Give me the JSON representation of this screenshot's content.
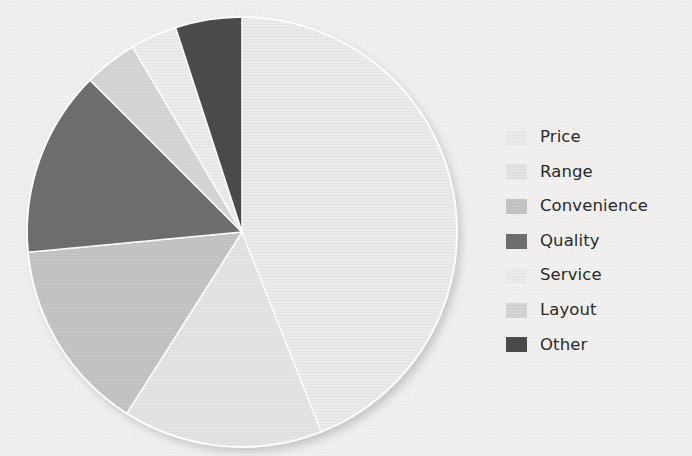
{
  "background": {
    "paper_color": "#f2f1ef"
  },
  "chart_data": {
    "type": "pie",
    "title": "",
    "subtitle": "",
    "xlabel": "",
    "ylabel": "",
    "grid": false,
    "legend_position": "right",
    "start_angle_deg": 0,
    "direction": "clockwise",
    "center": {
      "x": 242,
      "y": 232
    },
    "radius": 215,
    "labels": [
      "Price",
      "Range",
      "Convenience",
      "Quality",
      "Service",
      "Layout",
      "Other"
    ],
    "values": [
      44,
      15,
      14.5,
      14,
      3.5,
      4,
      5
    ],
    "unit": "percent",
    "colors": [
      "#eaeaea",
      "#e3e3e3",
      "#c4c4c4",
      "#6e6e6e",
      "#ebebeb",
      "#d5d5d5",
      "#4b4b4b"
    ],
    "slices": [
      {
        "label": "Price",
        "value": 44,
        "color": "#eaeaea",
        "start_deg": 0,
        "end_deg": 158.4,
        "legend_index": 0,
        "draw_order": 0
      },
      {
        "label": "Range",
        "value": 15,
        "color": "#e3e3e3",
        "start_deg": 158.4,
        "end_deg": 212.4,
        "legend_index": 1,
        "draw_order": 1
      },
      {
        "label": "Convenience",
        "value": 14.5,
        "color": "#c4c4c4",
        "start_deg": 212.4,
        "end_deg": 264.6,
        "legend_index": 2,
        "draw_order": 2
      },
      {
        "label": "Quality",
        "value": 14,
        "color": "#6e6e6e",
        "start_deg": 264.6,
        "end_deg": 315.0,
        "legend_index": 3,
        "draw_order": 3
      },
      {
        "label": "Layout",
        "value": 4,
        "color": "#d5d5d5",
        "start_deg": 315.0,
        "end_deg": 329.4,
        "legend_index": 5,
        "draw_order": 4
      },
      {
        "label": "Service",
        "value": 3.5,
        "color": "#ebebeb",
        "start_deg": 329.4,
        "end_deg": 342.0,
        "legend_index": 4,
        "draw_order": 5
      },
      {
        "label": "Other",
        "value": 5,
        "color": "#4b4b4b",
        "start_deg": 342.0,
        "end_deg": 360.0,
        "legend_index": 6,
        "draw_order": 6
      }
    ]
  },
  "legend": {
    "items": [
      {
        "label": "Price",
        "color": "#eaeaea"
      },
      {
        "label": "Range",
        "color": "#e3e3e3"
      },
      {
        "label": "Convenience",
        "color": "#c4c4c4"
      },
      {
        "label": "Quality",
        "color": "#6e6e6e"
      },
      {
        "label": "Service",
        "color": "#ebebeb"
      },
      {
        "label": "Layout",
        "color": "#d5d5d5"
      },
      {
        "label": "Other",
        "color": "#4b4b4b"
      }
    ]
  }
}
